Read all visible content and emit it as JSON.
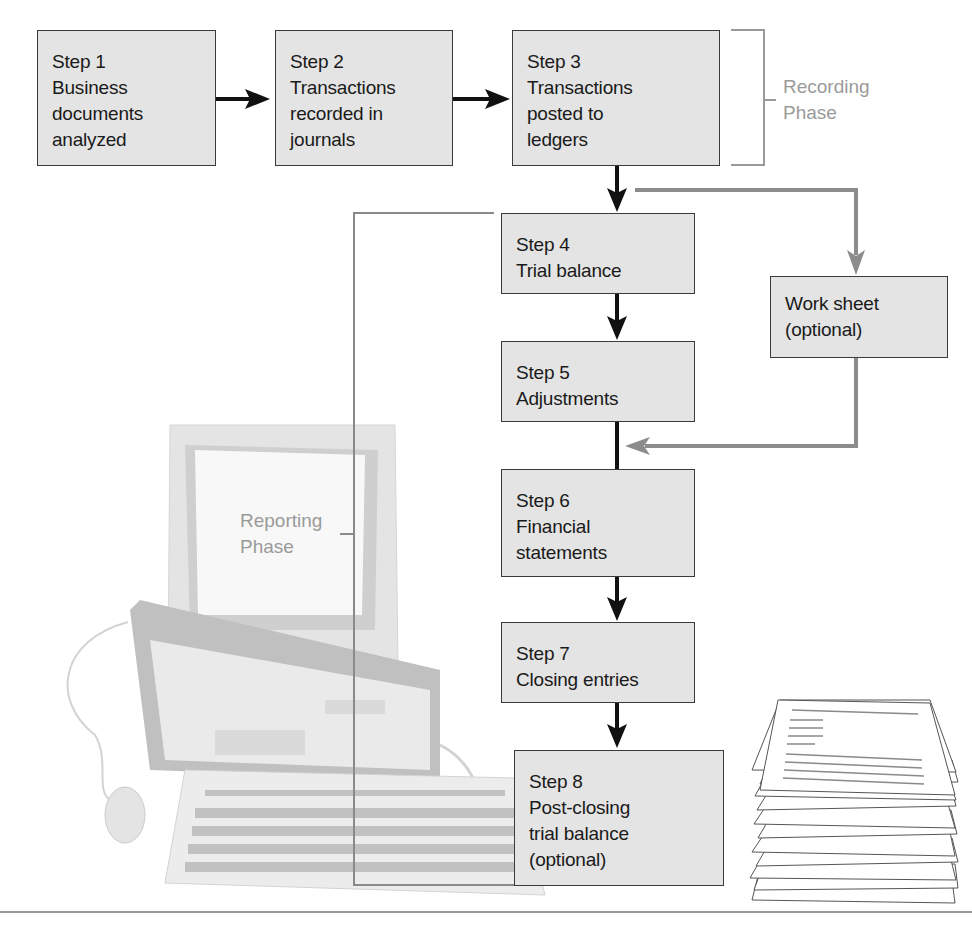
{
  "diagram": {
    "steps": [
      {
        "id": 1,
        "label": "Step 1",
        "lines": [
          "Business",
          "documents",
          "analyzed"
        ]
      },
      {
        "id": 2,
        "label": "Step 2",
        "lines": [
          "Transactions",
          "recorded in",
          "journals"
        ]
      },
      {
        "id": 3,
        "label": "Step 3",
        "lines": [
          "Transactions",
          "posted to",
          "ledgers"
        ]
      },
      {
        "id": 4,
        "label": "Step 4",
        "lines": [
          "Trial balance"
        ]
      },
      {
        "id": 5,
        "label": "Step 5",
        "lines": [
          "Adjustments"
        ]
      },
      {
        "id": 6,
        "label": "Step 6",
        "lines": [
          "Financial",
          "statements"
        ]
      },
      {
        "id": 7,
        "label": "Step 7",
        "lines": [
          "Closing entries"
        ]
      },
      {
        "id": 8,
        "label": "Step 8",
        "lines": [
          "Post-closing",
          "trial balance",
          "(optional)"
        ]
      }
    ],
    "worksheet": {
      "lines": [
        "Work sheet",
        "(optional)"
      ]
    },
    "phases": {
      "recording": [
        "Recording",
        "Phase"
      ],
      "reporting": [
        "Reporting",
        "Phase"
      ]
    },
    "colors": {
      "box_fill": "#e4e4e4",
      "box_border": "#3a3a3a",
      "main_arrow": "#111111",
      "optional_arrow": "#8c8c8c",
      "phase_text": "#9a9a9a"
    }
  },
  "illustrations": [
    "computer-illustration",
    "paper-stack-illustration"
  ]
}
